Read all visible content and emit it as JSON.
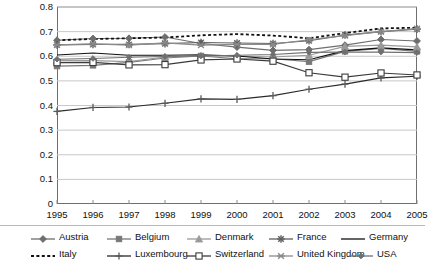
{
  "chart_data": {
    "type": "line",
    "title": "",
    "subtitle": "",
    "xlabel": "",
    "ylabel": "",
    "grid": true,
    "grid_axis": "y",
    "legend_position": "bottom",
    "xlim": [
      1995,
      2005
    ],
    "ylim": [
      0,
      0.8
    ],
    "ytick_step": 0.1,
    "x": [
      1995,
      1996,
      1997,
      1998,
      1999,
      2000,
      2001,
      2002,
      2003,
      2004,
      2005
    ],
    "xtick_labels": [
      "1995",
      "1996",
      "1997",
      "1998",
      "1999",
      "2000",
      "2001",
      "2002",
      "2003",
      "2004",
      "2005"
    ],
    "ytick_labels": [
      "0",
      "0.1",
      "0.2",
      "0.3",
      "0.4",
      "0.5",
      "0.6",
      "0.7",
      "0.8"
    ],
    "ytick_values": [
      0,
      0.1,
      0.2,
      0.3,
      0.4,
      0.5,
      0.6,
      0.7,
      0.8
    ],
    "series": [
      {
        "name": "Austria",
        "marker": "diamond",
        "marker_fill": "#6e6e6e",
        "line_style": "solid",
        "color": "#6e6e6e",
        "values": [
          0.665,
          0.672,
          0.673,
          0.678,
          0.652,
          0.637,
          0.624,
          0.627,
          0.645,
          0.668,
          0.662
        ]
      },
      {
        "name": "Belgium",
        "marker": "square",
        "marker_fill": "#787878",
        "line_style": "solid",
        "color": "#787878",
        "values": [
          0.56,
          0.563,
          0.575,
          0.593,
          0.601,
          0.59,
          0.59,
          0.578,
          0.62,
          0.632,
          0.62
        ]
      },
      {
        "name": "Denmark",
        "marker": "triangle",
        "marker_fill": "#9a9a9a",
        "line_style": "solid",
        "color": "#9a9a9a",
        "values": [
          0.582,
          0.582,
          0.578,
          0.597,
          0.602,
          0.6,
          0.597,
          0.604,
          0.64,
          0.645,
          0.638
        ]
      },
      {
        "name": "France",
        "marker": "star",
        "marker_fill": "#5f5f5f",
        "line_style": "solid",
        "color": "#5f5f5f",
        "values": [
          0.646,
          0.648,
          0.648,
          0.651,
          0.656,
          0.654,
          0.652,
          0.663,
          0.686,
          0.7,
          0.71
        ]
      },
      {
        "name": "Germany",
        "marker": "none",
        "marker_fill": "#111111",
        "line_style": "solid",
        "color": "#111111",
        "values": [
          0.605,
          0.613,
          0.604,
          0.604,
          0.606,
          0.601,
          0.589,
          0.586,
          0.623,
          0.634,
          0.626
        ]
      },
      {
        "name": "Italy",
        "marker": "none",
        "marker_fill": "#111111",
        "line_style": "dotted",
        "color": "#111111",
        "values": [
          0.665,
          0.67,
          0.673,
          0.676,
          0.685,
          0.69,
          0.684,
          0.673,
          0.694,
          0.713,
          0.716
        ]
      },
      {
        "name": "Luxembourg",
        "marker": "plus",
        "marker_fill": "#5a5a5a",
        "line_style": "solid",
        "color": "#2a2a2a",
        "values": [
          0.376,
          0.392,
          0.394,
          0.409,
          0.427,
          0.425,
          0.44,
          0.466,
          0.487,
          0.512,
          0.519
        ]
      },
      {
        "name": "Switzerland",
        "marker": "open-square",
        "marker_fill": "#ffffff",
        "line_style": "solid",
        "color": "#3a3a3a",
        "values": [
          0.574,
          0.575,
          0.565,
          0.566,
          0.585,
          0.589,
          0.58,
          0.533,
          0.515,
          0.532,
          0.524
        ]
      },
      {
        "name": "United Kingdom",
        "marker": "x-star",
        "marker_fill": "#8a8a8a",
        "line_style": "solid",
        "color": "#8a8a8a",
        "values": [
          0.646,
          0.65,
          0.645,
          0.654,
          0.645,
          0.648,
          0.648,
          0.667,
          0.684,
          0.7,
          0.712
        ]
      },
      {
        "name": "USA",
        "marker": "diamond-small",
        "marker_fill": "#707070",
        "line_style": "solid",
        "color": "#707070",
        "values": [
          0.588,
          0.591,
          0.596,
          0.599,
          0.601,
          0.604,
          0.607,
          0.616,
          0.617,
          0.617,
          0.615
        ]
      }
    ]
  },
  "legend": {
    "rows": [
      [
        "Austria",
        "Belgium",
        "Denmark",
        "France",
        "Germany"
      ],
      [
        "Italy",
        "Luxembourg",
        "Switzerland",
        "United Kingdom",
        "USA"
      ]
    ]
  }
}
